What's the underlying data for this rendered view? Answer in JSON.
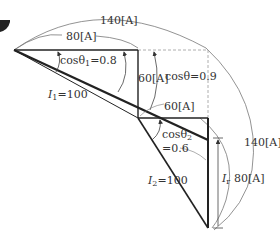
{
  "diagram": {
    "labels": {
      "outer_arc_top": "140[A]",
      "inner_arc_top": "80[A]",
      "cos_theta1": "cosθ",
      "cos_theta1_sub": "1",
      "cos_theta1_val": "=0.8",
      "I1_sym": "I",
      "I1_sub": "1",
      "I1_val": "=100",
      "reactive1": "60[A]",
      "cos_theta": "cosθ=0.9",
      "horizontal2": "60[A]",
      "cos_theta2": "cosθ",
      "cos_theta2_sub": "2",
      "cos_theta2_val": "=0.6",
      "I2_sym": "I",
      "I2_sub": "2",
      "I2_val": "=100",
      "Ir_sym": "I",
      "Ir_sub": "r",
      "right_arc_outer": "140[A]",
      "right_arc_inner": "80[A]"
    },
    "colors": {
      "line": "#222222",
      "thin": "#666666",
      "dashed": "#999999"
    }
  }
}
